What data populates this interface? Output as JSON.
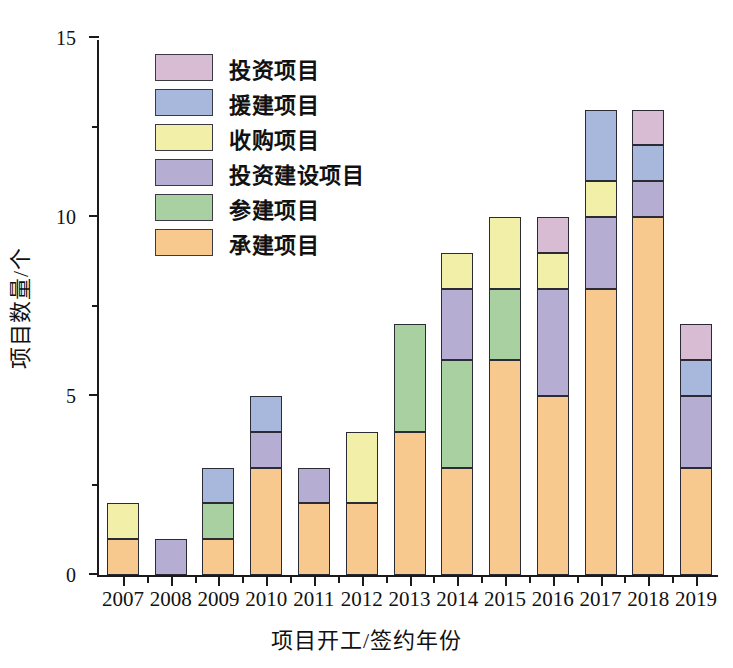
{
  "chart_data": {
    "type": "bar",
    "subtype": "stacked-bar",
    "title": "",
    "xlabel": "项目开工/签约年份",
    "ylabel": "项目数量/个",
    "categories": [
      "2007",
      "2008",
      "2009",
      "2010",
      "2011",
      "2012",
      "2013",
      "2014",
      "2015",
      "2016",
      "2017",
      "2018",
      "2019"
    ],
    "ylim": [
      0,
      15
    ],
    "yticks": [
      0,
      5,
      10,
      15
    ],
    "yticks_minor": [
      2.5,
      7.5,
      12.5
    ],
    "grid": false,
    "legend_position": "upper-left-inside",
    "stack_order_bottom_to_top": [
      "承建项目",
      "参建项目",
      "投资建设项目",
      "收购项目",
      "援建项目",
      "投资项目"
    ],
    "series": [
      {
        "name": "承建项目",
        "color": "#f7c98e",
        "values": [
          1,
          0,
          1,
          3,
          2,
          2,
          4,
          3,
          6,
          5,
          8,
          10,
          3
        ]
      },
      {
        "name": "参建项目",
        "color": "#a8d0a0",
        "values": [
          0,
          0,
          1,
          0,
          0,
          0,
          3,
          3,
          2,
          0,
          0,
          0,
          0
        ]
      },
      {
        "name": "投资建设项目",
        "color": "#b6aed2",
        "values": [
          0,
          1,
          0,
          1,
          1,
          0,
          0,
          2,
          0,
          3,
          2,
          1,
          2
        ]
      },
      {
        "name": "收购项目",
        "color": "#f2f0a8",
        "values": [
          1,
          0,
          0,
          0,
          0,
          2,
          0,
          1,
          2,
          1,
          1,
          0,
          0
        ]
      },
      {
        "name": "援建项目",
        "color": "#a8b8dc",
        "values": [
          0,
          0,
          1,
          1,
          0,
          0,
          0,
          0,
          0,
          0,
          2,
          1,
          1
        ]
      },
      {
        "name": "投资项目",
        "color": "#d8bcd4",
        "values": [
          0,
          0,
          0,
          0,
          0,
          0,
          0,
          0,
          0,
          1,
          0,
          1,
          1
        ]
      }
    ],
    "totals": [
      2,
      1,
      3,
      5,
      3,
      4,
      7,
      9,
      10,
      10,
      13,
      13,
      7
    ]
  },
  "legend": {
    "items": [
      {
        "label": "投资项目",
        "color": "#d8bcd4"
      },
      {
        "label": "援建项目",
        "color": "#a8b8dc"
      },
      {
        "label": "收购项目",
        "color": "#f2f0a8"
      },
      {
        "label": "投资建设项目",
        "color": "#b6aed2"
      },
      {
        "label": "参建项目",
        "color": "#a8d0a0"
      },
      {
        "label": "承建项目",
        "color": "#f7c98e"
      }
    ]
  },
  "axes": {
    "y_title": "项目数量/个",
    "x_title": "项目开工/签约年份",
    "y_tick_labels": [
      "0",
      "5",
      "10",
      "15"
    ]
  },
  "colors": {
    "axis": "#1a1a1a",
    "bar_outline": "#2b2b35",
    "background": "#ffffff"
  }
}
